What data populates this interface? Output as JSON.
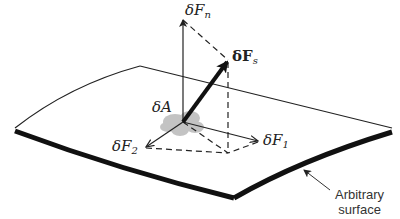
{
  "diagram": {
    "labels": {
      "dFn": {
        "prefix": "δF",
        "sub": "n"
      },
      "dFs": {
        "prefix": "δF",
        "sub": "s"
      },
      "dF1": {
        "prefix": "δF",
        "sub": "1"
      },
      "dF2": {
        "prefix": "δF",
        "sub": "2"
      },
      "dA": "δA"
    },
    "caption": {
      "line1": "Arbitrary",
      "line2": "surface"
    },
    "colors": {
      "line": "#222222",
      "area_patch": "#bdbdbd",
      "background": "#ffffff"
    }
  }
}
